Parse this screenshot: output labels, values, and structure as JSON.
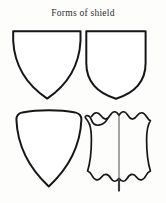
{
  "plate": {
    "title": "Forms of shield",
    "background_color": "#fdfdfb",
    "ink_color": "#16161a",
    "fill_color": "#ffffff",
    "centerline_color": "#5d5d66"
  },
  "figures": [
    {
      "id": "heater",
      "name": "heater-shield",
      "position": "top-left",
      "description": "Flat top edge with sharp square corners, sides tapering in straight-to-slightly-curved lines to a sharp point at the bottom centre.",
      "top_edge": "straight",
      "bottom": "pointed",
      "has_centerline": false,
      "edge_style": "smooth"
    },
    {
      "id": "square",
      "name": "square-sided-shield",
      "position": "top-right",
      "description": "Flat top edge, near-vertical parallel sides for the upper two thirds, then curving to a rounded point at the bottom centre.",
      "top_edge": "straight",
      "bottom": "rounded-point",
      "has_centerline": false,
      "edge_style": "smooth"
    },
    {
      "id": "curvedtop",
      "name": "curved-top-shield",
      "position": "bottom-left",
      "description": "Convex arched top edge with rounded upper corners, sides sweeping inward to a sharp point at the bottom centre.",
      "top_edge": "convex-arc",
      "bottom": "pointed",
      "has_centerline": false,
      "edge_style": "smooth"
    },
    {
      "id": "targe",
      "name": "jousting-targe-shield",
      "position": "bottom-right",
      "description": "Jousting targe with scalloped wavy top and bottom edges, slightly concave sides, a vertical ridge line down the centre and a curled bouche notch at the upper left.",
      "top_edge": "scalloped",
      "bottom": "scalloped-with-point",
      "has_centerline": true,
      "has_bouche_notch": true,
      "edge_style": "scalloped"
    }
  ]
}
